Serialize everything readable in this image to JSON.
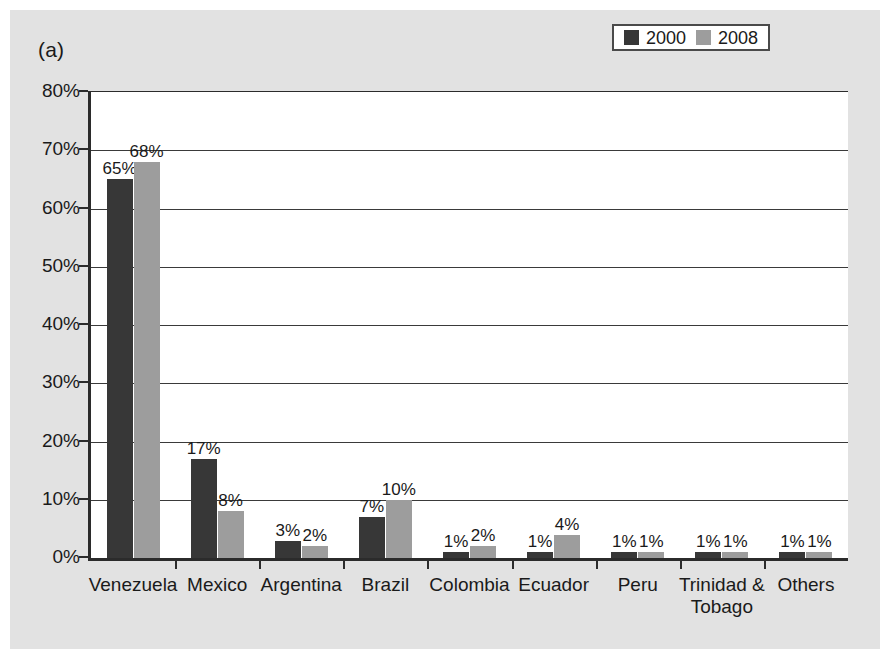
{
  "figure": {
    "panel_label": "(a)",
    "background_color": "#e2e2e2",
    "plot_background_color": "#ffffff"
  },
  "chart_data": {
    "type": "bar",
    "title": "",
    "xlabel": "",
    "ylabel": "",
    "ylim": [
      0,
      80
    ],
    "yticks": [
      0,
      10,
      20,
      30,
      40,
      50,
      60,
      70,
      80
    ],
    "ytick_labels": [
      "0%",
      "10%",
      "20%",
      "30%",
      "40%",
      "50%",
      "60%",
      "70%",
      "80%"
    ],
    "grid": true,
    "legend_position": "top-right",
    "categories": [
      "Venezuela",
      "Mexico",
      "Argentina",
      "Brazil",
      "Colombia",
      "Ecuador",
      "Peru",
      "Trinidad &\nTobago",
      "Others"
    ],
    "series": [
      {
        "name": "2000",
        "color": "#373737",
        "values": [
          65,
          17,
          3,
          7,
          1,
          1,
          1,
          1,
          1
        ],
        "labels": [
          "65%",
          "17%",
          "3%",
          "7%",
          "1%",
          "1%",
          "1%",
          "1%",
          "1%"
        ]
      },
      {
        "name": "2008",
        "color": "#9d9d9d",
        "values": [
          68,
          8,
          2,
          10,
          2,
          4,
          1,
          1,
          1
        ],
        "labels": [
          "68%",
          "8%",
          "2%",
          "10%",
          "2%",
          "4%",
          "1%",
          "1%",
          "1%"
        ]
      }
    ]
  },
  "legend": {
    "entries": [
      {
        "label": "2000",
        "color": "#373737"
      },
      {
        "label": "2008",
        "color": "#9d9d9d"
      }
    ]
  }
}
